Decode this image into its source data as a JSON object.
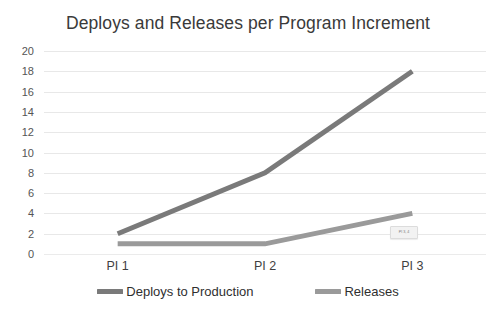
{
  "chart_data": {
    "type": "line",
    "title": "Deploys and Releases per Program Increment",
    "xlabel": "",
    "ylabel": "",
    "categories": [
      "PI 1",
      "PI 2",
      "PI 3"
    ],
    "series": [
      {
        "name": "Deploys to Production",
        "values": [
          2,
          8,
          18
        ],
        "color": "#7a7a7a"
      },
      {
        "name": "Releases",
        "values": [
          1,
          1,
          4
        ],
        "color": "#9a9a9a"
      }
    ],
    "ylim": [
      0,
      20
    ],
    "ytick_step": 2,
    "yticks": [
      20,
      18,
      16,
      14,
      12,
      10,
      8,
      6,
      4,
      2,
      0
    ],
    "grid": true,
    "grid_axis": "y",
    "grid_color": "#e8e8e8",
    "legend_position": "bottom",
    "background": "#ffffff",
    "annotations": [
      {
        "name": "point-tooltip",
        "text": "PI 3, 4",
        "near_series": "Releases",
        "near_category": "PI 3"
      }
    ]
  }
}
